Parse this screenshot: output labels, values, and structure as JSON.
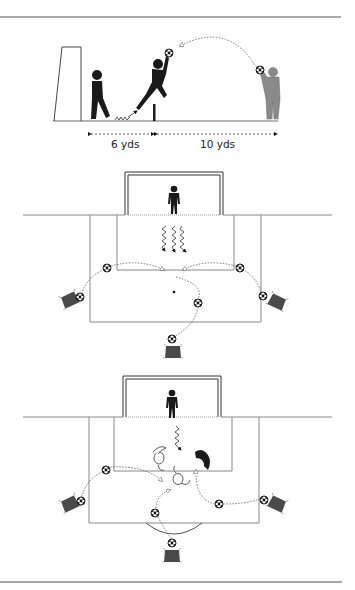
{
  "diagram": {
    "type": "soccer goalkeeper training drill",
    "panels": [
      {
        "id": "panel-1",
        "view": "side",
        "description": "Goalkeeper jumps off marker to catch ball thrown by server; second keeper stands at goal",
        "distances": [
          {
            "label": "6 yds"
          },
          {
            "label": "10 yds"
          }
        ]
      },
      {
        "id": "panel-2",
        "view": "top-down",
        "description": "Keeper in goal with three movement arrows; servers with balls around penalty area"
      },
      {
        "id": "panel-3",
        "view": "top-down",
        "description": "Keeper diving, defenders in box, servers crossing balls"
      }
    ],
    "colors": {
      "line": "#777777",
      "rule": "#555555",
      "figure_dark": "#1a1a1a",
      "figure_grey": "#8a8a8a",
      "cone": "#4a4a4a"
    }
  }
}
